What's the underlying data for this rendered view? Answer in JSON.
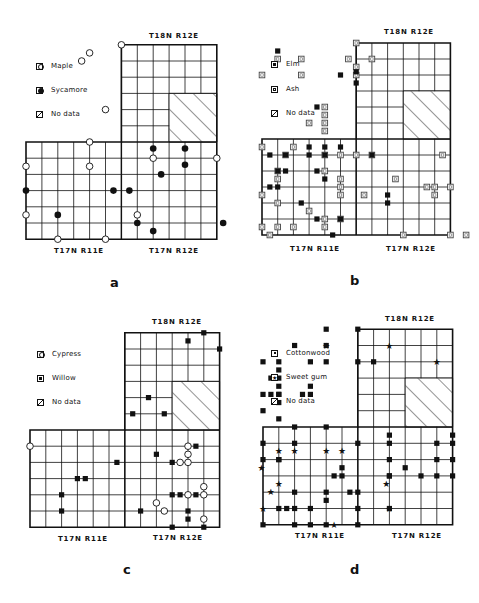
{
  "figure": {
    "caption": "",
    "grid": {
      "cell_px": 16,
      "lower_block": {
        "cols": 12,
        "rows": 6,
        "labels": [
          "T17N R11E",
          "T17N R12E"
        ]
      },
      "upper_block": {
        "cols": 6,
        "rows": 6,
        "label": "T18N R12E"
      },
      "no_data_region": "hatched lower-right of upper block"
    },
    "panels": [
      {
        "letter": "a",
        "legend": [
          {
            "symbol": "open-circle",
            "label": "Maple"
          },
          {
            "symbol": "filled-circle",
            "label": "Sycamore"
          },
          {
            "symbol": "hatch",
            "label": "No data"
          }
        ],
        "labels": {
          "top": "T18N R12E",
          "bottom_left": "T17N R11E",
          "bottom_right": "T17N R12E"
        }
      },
      {
        "letter": "b",
        "legend": [
          {
            "symbol": "filled-square",
            "label": "Elm"
          },
          {
            "symbol": "open-square",
            "label": "Ash"
          },
          {
            "symbol": "hatch",
            "label": "No data"
          }
        ],
        "labels": {
          "top": "T18N R12E",
          "bottom_left": "T17N R11E",
          "bottom_right": "T17N R12E"
        }
      },
      {
        "letter": "c",
        "legend": [
          {
            "symbol": "open-circle",
            "label": "Cypress"
          },
          {
            "symbol": "filled-square",
            "label": "Willow"
          },
          {
            "symbol": "hatch",
            "label": "No data"
          }
        ],
        "labels": {
          "top": "T18N R12E",
          "bottom_left": "T17N R11E",
          "bottom_right": "T17N R12E"
        }
      },
      {
        "letter": "d",
        "legend": [
          {
            "symbol": "filled-square",
            "label": "Cottonwood"
          },
          {
            "symbol": "star",
            "label": "Sweet gum"
          },
          {
            "symbol": "hatch",
            "label": "No data"
          }
        ],
        "labels": {
          "top": "T18N R12E",
          "bottom_left": "T17N R11E",
          "bottom_right": "T17N R12E"
        }
      }
    ]
  },
  "markers": {
    "a": {
      "open_circle": [
        [
          6,
          -6
        ],
        [
          4,
          -5.5
        ],
        [
          3.5,
          -5
        ],
        [
          5,
          -2
        ],
        [
          4,
          0
        ],
        [
          0,
          1.5
        ],
        [
          4,
          1.5
        ],
        [
          8,
          1
        ],
        [
          12,
          1
        ],
        [
          16,
          1.5
        ],
        [
          0,
          4.5
        ],
        [
          7,
          4.5
        ],
        [
          2,
          6
        ],
        [
          5,
          6
        ]
      ],
      "filled_circle": [
        [
          8,
          0.4
        ],
        [
          10,
          0.4
        ],
        [
          10,
          1.4
        ],
        [
          8.5,
          2
        ],
        [
          0,
          3
        ],
        [
          5.5,
          3
        ],
        [
          6.5,
          3
        ],
        [
          2,
          4.5
        ],
        [
          7,
          5
        ],
        [
          8,
          5.5
        ],
        [
          12.4,
          5
        ]
      ]
    },
    "b": {
      "open_square": [
        [
          6,
          -6
        ],
        [
          1,
          -5
        ],
        [
          2.5,
          -5
        ],
        [
          5.5,
          -5
        ],
        [
          7,
          -5
        ],
        [
          0,
          -4
        ],
        [
          2.5,
          -4
        ],
        [
          6,
          -4.5
        ],
        [
          6,
          -4
        ],
        [
          4,
          -2
        ],
        [
          4,
          -1.5
        ],
        [
          3,
          -1
        ],
        [
          4,
          -1
        ],
        [
          4,
          -0.5
        ],
        [
          0,
          0.5
        ],
        [
          2,
          0.5
        ],
        [
          1.5,
          1
        ],
        [
          4,
          1
        ],
        [
          5,
          1
        ],
        [
          6,
          1
        ],
        [
          7,
          1
        ],
        [
          11.5,
          1
        ],
        [
          1,
          2
        ],
        [
          4,
          2
        ],
        [
          8.5,
          2.5
        ],
        [
          1,
          2.5
        ],
        [
          5,
          2.5
        ],
        [
          0,
          3.5
        ],
        [
          5,
          3
        ],
        [
          5,
          3.5
        ],
        [
          10.5,
          3
        ],
        [
          11,
          3
        ],
        [
          12,
          3
        ],
        [
          1,
          4
        ],
        [
          6.5,
          3.5
        ],
        [
          11,
          3.5
        ],
        [
          3,
          4.5
        ],
        [
          4,
          5
        ],
        [
          0,
          5.5
        ],
        [
          1,
          5.5
        ],
        [
          2,
          5.5
        ],
        [
          4,
          5.5
        ],
        [
          5,
          5
        ],
        [
          0.5,
          6
        ],
        [
          9,
          6
        ],
        [
          13,
          6
        ],
        [
          12,
          6
        ]
      ],
      "filled_square": [
        [
          1,
          -5.5
        ],
        [
          5,
          -4
        ],
        [
          6,
          -4.2
        ],
        [
          6,
          -3.5
        ],
        [
          3.5,
          -2
        ],
        [
          3,
          0.5
        ],
        [
          4,
          0.5
        ],
        [
          5,
          0.5
        ],
        [
          0.5,
          1
        ],
        [
          1.5,
          1
        ],
        [
          3,
          1
        ],
        [
          4,
          1
        ],
        [
          7,
          1
        ],
        [
          1,
          2
        ],
        [
          1.5,
          2
        ],
        [
          3.5,
          2
        ],
        [
          4,
          2.5
        ],
        [
          0.5,
          3
        ],
        [
          1,
          3
        ],
        [
          8,
          3.5
        ],
        [
          2.5,
          4
        ],
        [
          8,
          4
        ],
        [
          3.5,
          5
        ],
        [
          5,
          5
        ],
        [
          4.5,
          6
        ]
      ]
    },
    "c": {
      "open_circle": [
        [
          0,
          1
        ],
        [
          10,
          1
        ],
        [
          10,
          1.5
        ],
        [
          9.5,
          2
        ],
        [
          10,
          2
        ],
        [
          11,
          3.5
        ],
        [
          10,
          4
        ],
        [
          11,
          4
        ],
        [
          8,
          4.5
        ],
        [
          8.5,
          5
        ],
        [
          11,
          5.5
        ]
      ],
      "filled_square": [
        [
          11,
          -6
        ],
        [
          10,
          -5.5
        ],
        [
          12,
          -5
        ],
        [
          7.5,
          -2
        ],
        [
          6.5,
          -1
        ],
        [
          8.5,
          -1
        ],
        [
          10.5,
          1
        ],
        [
          8,
          1.5
        ],
        [
          5.5,
          2
        ],
        [
          9,
          2
        ],
        [
          3,
          3
        ],
        [
          3.5,
          3
        ],
        [
          2,
          4
        ],
        [
          9,
          4
        ],
        [
          9.5,
          4
        ],
        [
          10.5,
          4
        ],
        [
          2,
          5
        ],
        [
          7,
          5
        ],
        [
          10,
          5
        ],
        [
          10,
          5.5
        ],
        [
          9,
          6
        ],
        [
          11,
          6
        ]
      ]
    },
    "d": {
      "filled_square": [
        [
          4,
          -6
        ],
        [
          6,
          -6
        ],
        [
          2,
          -5
        ],
        [
          4,
          -5
        ],
        [
          0,
          -4
        ],
        [
          1,
          -4
        ],
        [
          3,
          -4
        ],
        [
          4,
          -4
        ],
        [
          6,
          -4
        ],
        [
          7,
          -4
        ],
        [
          1,
          -3.5
        ],
        [
          1,
          -3
        ],
        [
          0.5,
          -3
        ],
        [
          1,
          -2.5
        ],
        [
          1,
          -2
        ],
        [
          3,
          -2.5
        ],
        [
          0,
          -2
        ],
        [
          0.5,
          -2
        ],
        [
          1,
          -2
        ],
        [
          2.5,
          -2
        ],
        [
          3,
          -2
        ],
        [
          1,
          -1.5
        ],
        [
          0,
          -1
        ],
        [
          1,
          -0.5
        ],
        [
          8,
          0.5
        ],
        [
          8,
          1
        ],
        [
          6,
          1
        ],
        [
          8,
          2
        ],
        [
          9,
          2.5
        ],
        [
          8,
          3
        ],
        [
          1,
          2
        ],
        [
          5,
          2.5
        ],
        [
          8,
          3
        ],
        [
          0,
          1
        ],
        [
          4,
          0
        ],
        [
          2,
          0
        ],
        [
          0,
          2
        ],
        [
          5,
          3
        ],
        [
          5.5,
          4
        ],
        [
          6,
          5
        ],
        [
          6,
          6
        ],
        [
          4.5,
          3
        ],
        [
          4,
          4
        ],
        [
          8,
          5
        ],
        [
          10,
          3
        ],
        [
          11,
          1
        ],
        [
          11,
          2
        ],
        [
          11,
          3
        ],
        [
          12,
          0.5
        ],
        [
          12,
          1
        ],
        [
          12,
          2
        ],
        [
          12,
          3
        ],
        [
          2,
          1
        ],
        [
          1,
          2
        ],
        [
          2,
          4
        ],
        [
          6,
          4
        ],
        [
          4,
          4.5
        ],
        [
          1,
          5
        ],
        [
          1.5,
          5
        ],
        [
          2,
          5
        ],
        [
          3,
          5
        ],
        [
          2,
          6
        ],
        [
          3,
          6
        ],
        [
          4,
          6
        ],
        [
          0,
          6
        ]
      ],
      "star": [
        [
          4,
          -5
        ],
        [
          8,
          -5
        ],
        [
          11,
          -4
        ],
        [
          2,
          1.5
        ],
        [
          1,
          1.5
        ],
        [
          4,
          1.5
        ],
        [
          5,
          1.5
        ],
        [
          -0.1,
          2.5
        ],
        [
          1,
          3.5
        ],
        [
          0.5,
          4
        ],
        [
          0,
          5
        ],
        [
          4.5,
          6
        ],
        [
          7.8,
          3.5
        ],
        [
          8,
          5
        ]
      ]
    }
  }
}
